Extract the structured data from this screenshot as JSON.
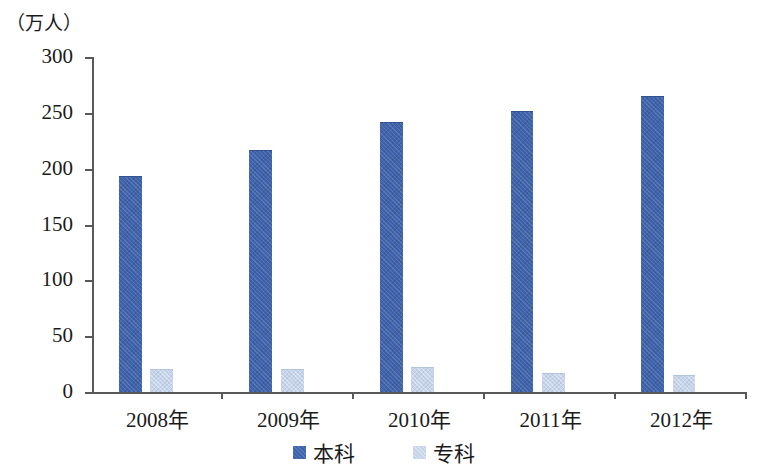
{
  "chart_data": {
    "type": "bar",
    "title": "",
    "subtitle": "",
    "xlabel": "",
    "ylabel": "（万人）",
    "unit_caption": "（万人）",
    "categories": [
      "2008年",
      "2009年",
      "2010年",
      "2011年",
      "2012年"
    ],
    "series": [
      {
        "name": "本科",
        "color": "#3f64ad",
        "values": [
          193,
          217,
          242,
          252,
          265
        ]
      },
      {
        "name": "专科",
        "color": "#c6d4ea",
        "values": [
          21,
          21,
          22,
          17,
          15
        ]
      }
    ],
    "ylim": [
      0,
      300
    ],
    "yticks": [
      0,
      50,
      100,
      150,
      200,
      250,
      300
    ],
    "ytick_labels": [
      "0",
      "50",
      "100",
      "150",
      "200",
      "250",
      "300"
    ],
    "grid": false,
    "legend_position": "bottom-center",
    "legend_entries": [
      {
        "label": "本科",
        "color": "#3f64ad"
      },
      {
        "label": "专科",
        "color": "#c6d4ea"
      }
    ],
    "annotations": []
  },
  "axis": {
    "unit_label": "（万人）",
    "line_color": "#595959"
  },
  "xaxis": {
    "labels": [
      "2008年",
      "2009年",
      "2010年",
      "2011年",
      "2012年"
    ]
  },
  "yaxis": {
    "labels": [
      "300",
      "250",
      "200",
      "150",
      "100",
      "50",
      "0"
    ]
  },
  "legend": {
    "items": [
      {
        "label": "本科"
      },
      {
        "label": "专科"
      }
    ]
  }
}
